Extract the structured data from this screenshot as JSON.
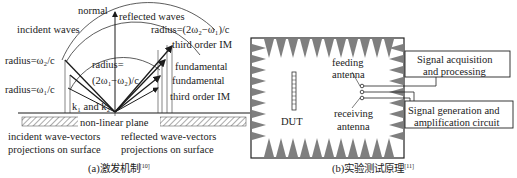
{
  "panel_a": {
    "labels": {
      "normal": "normal",
      "reflected_waves": "reflected waves",
      "incident_waves": "incident waves",
      "radius_2w2_w1": "radius=(2ω₂−ω₁)/c",
      "third_order_im_top": "third order IM",
      "radius_w2": "radius=ω₂/c",
      "radius_eq": "radius=",
      "radius_2w1_w2": "(2ω₁−ω₂)/c",
      "fundamental_1": "fundamental",
      "fundamental_2": "fundamental",
      "radius_w1": "radius=ω₁/c",
      "third_order_im_bottom": "third order IM",
      "k_label": "k₁ and k₂",
      "plane": "non-linear plane",
      "incident_proj_1": "incident wave-vectors",
      "incident_proj_2": "projections on surface",
      "reflected_proj_1": "reflected wave-vectors",
      "reflected_proj_2": "projections on surface"
    },
    "caption": "(a)激发机制",
    "caption_ref": "[10]"
  },
  "panel_b": {
    "labels": {
      "feeding_1": "feeding",
      "feeding_2": "antenna",
      "dut": "DUT",
      "receiving_1": "receiving",
      "receiving_2": "antenna"
    },
    "boxes": {
      "acq_1": "Signal acquisition",
      "acq_2": "and processing",
      "gen_1": "Signal generation and",
      "gen_2": "amplification circuit"
    },
    "caption": "(b)实验测试原理",
    "caption_ref": "[11]"
  },
  "colors": {
    "absorber": "#808080",
    "line": "#1a1a1a",
    "hatch": "#555555"
  }
}
